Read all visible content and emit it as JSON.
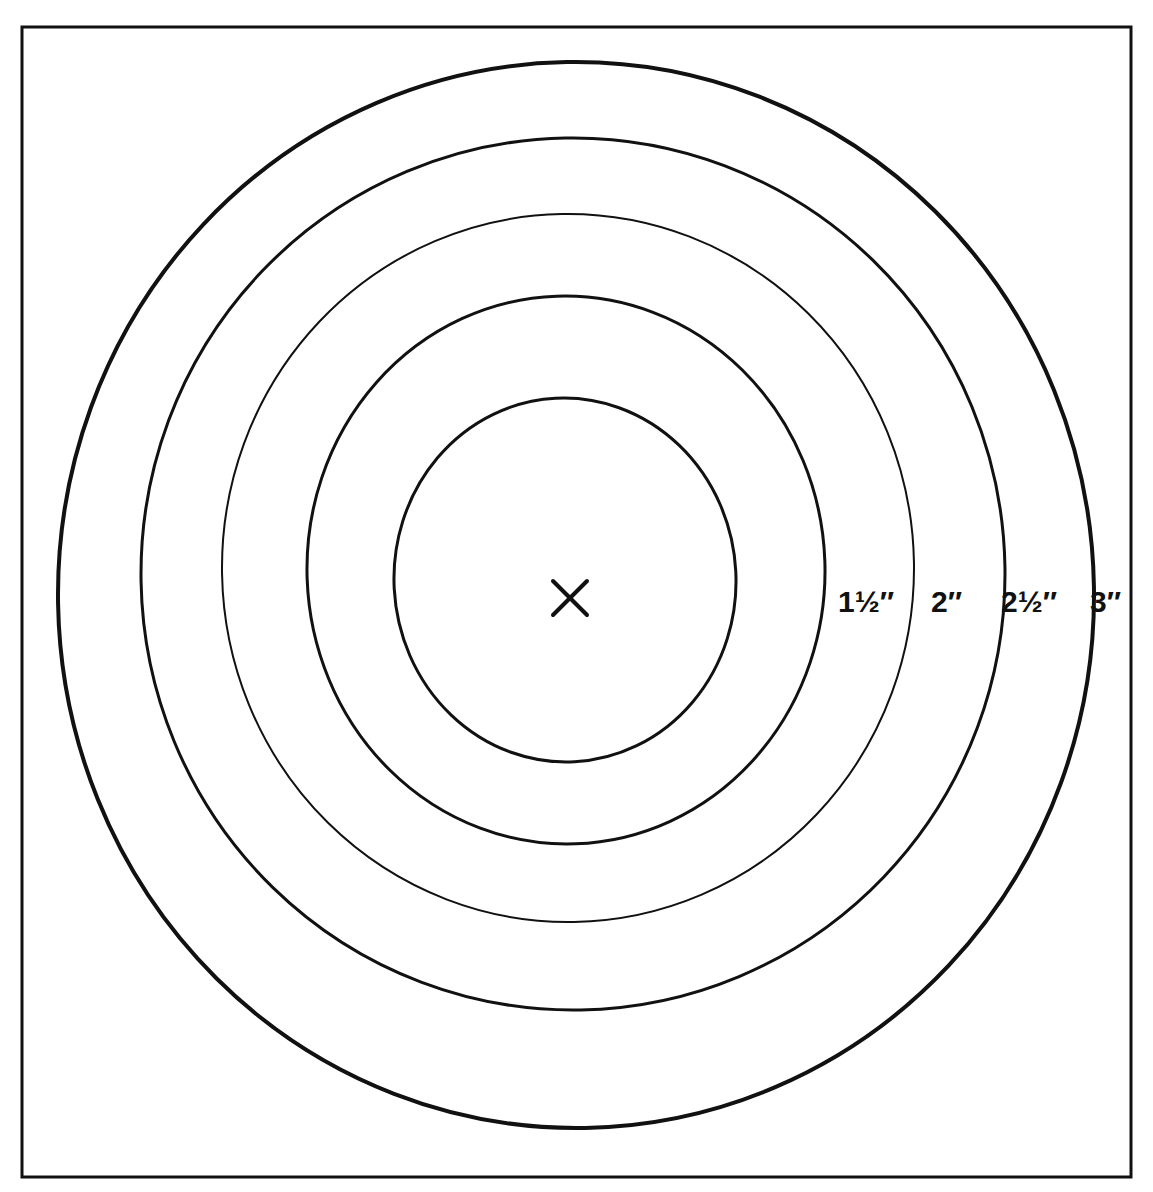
{
  "figure": {
    "background_color": "#ffffff",
    "ink_color": "#111111",
    "border": {
      "name": "outer-frame",
      "x": 22,
      "y": 27,
      "width": 1109,
      "height": 1150,
      "stroke_width": 3,
      "color": "#111111"
    },
    "center_mark": {
      "name": "center-cross",
      "glyph": "X",
      "x": 570,
      "y": 598,
      "size": 34,
      "stroke_width": 4
    },
    "rings": [
      {
        "id": "ring-1",
        "label": "",
        "cx": 565,
        "cy": 580,
        "rx": 171,
        "ry": 182,
        "stroke_width": 3,
        "rotate": -3
      },
      {
        "id": "ring-2",
        "label": "1½″",
        "label_number": "1",
        "label_fraction": "½",
        "label_unit": "″",
        "cx": 566,
        "cy": 570,
        "rx": 259,
        "ry": 274,
        "stroke_width": 3,
        "rotate": -2,
        "label_x": 838,
        "label_y": 612
      },
      {
        "id": "ring-3",
        "label": "2″",
        "label_number": "2",
        "label_fraction": "",
        "label_unit": "″",
        "cx": 568,
        "cy": 568,
        "rx": 346,
        "ry": 354,
        "stroke_width": 2,
        "rotate": -1,
        "label_x": 931,
        "label_y": 612
      },
      {
        "id": "ring-4",
        "label": "2½″",
        "label_number": "2",
        "label_fraction": "½",
        "label_unit": "″",
        "cx": 573,
        "cy": 574,
        "rx": 432,
        "ry": 436,
        "stroke_width": 3,
        "rotate": -1,
        "label_x": 1001,
        "label_y": 612
      },
      {
        "id": "ring-5",
        "label": "3″",
        "label_number": "3",
        "label_fraction": "",
        "label_unit": "″",
        "cx": 576,
        "cy": 595,
        "rx": 518,
        "ry": 533,
        "stroke_width": 4,
        "rotate": -1,
        "label_x": 1090,
        "label_y": 612
      }
    ]
  },
  "chart_data": {
    "type": "scatter",
    "subtitle": "",
    "xlabel": "",
    "ylabel": "",
    "grid": false,
    "legend_position": "inline-right",
    "categories": [
      "1½″",
      "2″",
      "2½″",
      "3″"
    ],
    "series": [
      {
        "name": "Circle diameter (inches)",
        "values": [
          1.5,
          2,
          2.5,
          3
        ]
      },
      {
        "name": "Drawn horizontal diameter (px)",
        "values": [
          518,
          693,
          864,
          1037
        ]
      },
      {
        "name": "Drawn vertical diameter (px)",
        "values": [
          549,
          708,
          872,
          1066
        ]
      }
    ],
    "annotations": [
      {
        "text": "X",
        "x": 570,
        "y": 598,
        "note": "centre mark"
      }
    ]
  }
}
